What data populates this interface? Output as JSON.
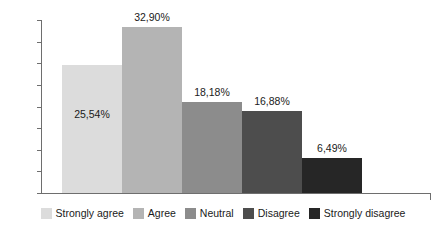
{
  "chart_data": {
    "type": "bar",
    "title": "",
    "xlabel": "",
    "ylabel": "",
    "grid": false,
    "legend_position": "bottom",
    "ylim": [
      0,
      80
    ],
    "yticks": [
      80,
      70,
      60,
      50,
      40,
      30,
      20,
      10,
      0
    ],
    "ytick_labels": [
      "80",
      "70",
      "60",
      "50",
      "40",
      "30",
      "20",
      "10",
      "0"
    ],
    "categories": [
      "Strongly agree",
      "Agree",
      "Neutral",
      "Disagree",
      "Strongly disagree"
    ],
    "values": [
      59,
      77,
      42,
      38,
      16
    ],
    "data_labels": [
      "25,54%",
      "32,90%",
      "18,18%",
      "16,88%",
      "6,49%"
    ],
    "label_placement": [
      "inside",
      "above",
      "above",
      "above",
      "above"
    ],
    "colors": [
      "#dcdcdc",
      "#b4b4b4",
      "#8c8c8c",
      "#4d4d4d",
      "#262626"
    ],
    "series": [
      {
        "name": "Responses",
        "values": [
          59,
          77,
          42,
          38,
          16
        ]
      }
    ]
  },
  "legend": {
    "items": [
      {
        "label": "Strongly agree",
        "color": "#dcdcdc"
      },
      {
        "label": "Agree",
        "color": "#b4b4b4"
      },
      {
        "label": "Neutral",
        "color": "#8c8c8c"
      },
      {
        "label": "Disagree",
        "color": "#4d4d4d"
      },
      {
        "label": "Strongly disagree",
        "color": "#262626"
      }
    ]
  }
}
